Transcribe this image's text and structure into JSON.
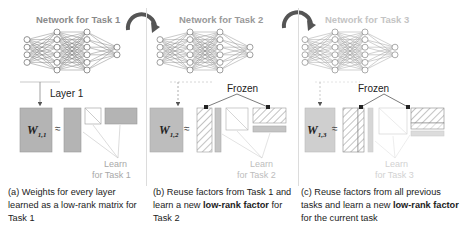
{
  "panels": [
    {
      "id": "a",
      "network_title": "Network for Task 1",
      "title_color": "#8a8a8a",
      "layer_label": "Layer 1",
      "matrix_label_main": "W",
      "matrix_label_sub": "1,1",
      "approx_symbol": "≈",
      "learn_label_line1": "Learn",
      "learn_label_line2": "for Task 1",
      "caption_prefix": "(a) Weights for every layer learned as a low-rank matrix for Task 1",
      "caption_bold": "",
      "caption_suffix": ""
    },
    {
      "id": "b",
      "network_title": "Network for Task 2",
      "title_color": "#999999",
      "frozen_label": "Frozen",
      "matrix_label_main": "W",
      "matrix_label_sub": "1,2",
      "approx_symbol": "≈",
      "learn_label_line1": "Learn",
      "learn_label_line2": "for Task 2",
      "caption_prefix": "(b) Reuse factors from Task 1 and learn a new ",
      "caption_bold": "low-rank factor",
      "caption_suffix": " for Task 2"
    },
    {
      "id": "c",
      "network_title": "Network for Task 3",
      "title_color": "#c4c4c4",
      "frozen_label": "Frozen",
      "matrix_label_main": "W",
      "matrix_label_sub": "1,3",
      "approx_symbol": "≈",
      "learn_label_line1": "Learn",
      "learn_label_line2": "for Task 3",
      "caption_prefix": "(c) Reuse factors from all previous tasks and learn a new ",
      "caption_bold": "low-rank factor",
      "caption_suffix": " for the current task"
    }
  ],
  "colors": {
    "matrix_gray": "#b4b4b4",
    "learn_text": "#a8a8a8",
    "arrow": "#555555"
  }
}
